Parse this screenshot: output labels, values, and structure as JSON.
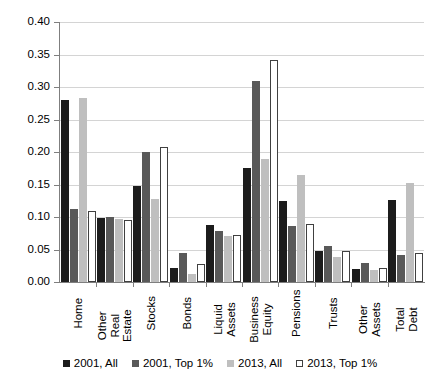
{
  "chart_data": {
    "type": "bar",
    "title": "",
    "xlabel": "",
    "ylabel": "",
    "ylim": [
      0,
      0.4
    ],
    "ytick_labels": [
      "0.00",
      "0.05",
      "0.10",
      "0.15",
      "0.20",
      "0.25",
      "0.30",
      "0.35",
      "0.40"
    ],
    "ytick_values": [
      0,
      0.05,
      0.1,
      0.15,
      0.2,
      0.25,
      0.3,
      0.35,
      0.4
    ],
    "grid": true,
    "legend_position": "bottom",
    "categories": [
      "Home",
      "Other Real Estate",
      "Stocks",
      "Bonds",
      "Liquid Assets",
      "Business Equity",
      "Pensions",
      "Trusts",
      "Other Assets",
      "Total Debt"
    ],
    "series": [
      {
        "name": "2001, All",
        "color": "#1c1c1c",
        "values": [
          0.28,
          0.098,
          0.147,
          0.022,
          0.087,
          0.176,
          0.124,
          0.048,
          0.02,
          0.126
        ]
      },
      {
        "name": "2001, Top 1%",
        "color": "#595959",
        "values": [
          0.112,
          0.1,
          0.2,
          0.045,
          0.079,
          0.31,
          0.086,
          0.055,
          0.03,
          0.042
        ]
      },
      {
        "name": "2013, All",
        "color": "#bfbfbf",
        "values": [
          0.283,
          0.097,
          0.127,
          0.012,
          0.071,
          0.189,
          0.164,
          0.038,
          0.018,
          0.152
        ]
      },
      {
        "name": "2013, Top 1%",
        "color": "#ffffff",
        "values": [
          0.11,
          0.095,
          0.207,
          0.028,
          0.072,
          0.341,
          0.09,
          0.048,
          0.022,
          0.045
        ]
      }
    ]
  }
}
